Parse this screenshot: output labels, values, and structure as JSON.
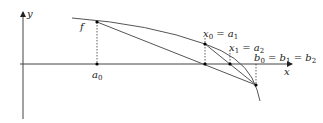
{
  "diagram": {
    "axes": {
      "x_label": "x",
      "y_label": "y"
    },
    "function_label": "f",
    "points": [
      {
        "id": "a0",
        "label": "a",
        "sub": "0"
      },
      {
        "id": "x0",
        "label_parts": [
          "x",
          "0",
          " = a",
          "1"
        ]
      },
      {
        "id": "x1",
        "label_parts": [
          "x",
          "1",
          " = a",
          "2"
        ]
      },
      {
        "id": "b0",
        "label_parts": [
          "b",
          "0",
          " = b",
          "1",
          " = b",
          "2"
        ]
      }
    ],
    "colors": {
      "axis": "#333333",
      "curve": "#555555",
      "secant": "#555555",
      "dotted": "#333333",
      "point": "#000000"
    }
  }
}
